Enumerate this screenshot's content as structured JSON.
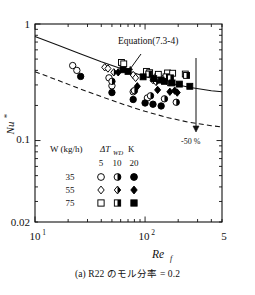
{
  "figure": {
    "caption": "(a) R22 のモル分率 = 0.2",
    "caption_label": "(a)",
    "caption_text": "R22 のモル分率 = 0.2"
  },
  "chart_data": {
    "type": "scatter",
    "title": "",
    "xlabel": "Re_f",
    "xlabel_main": "Re",
    "xlabel_sub": "f",
    "ylabel": "Nu*",
    "ylabel_main": "Nu",
    "ylabel_sup": "*",
    "xscale": "log",
    "yscale": "log",
    "xlim": [
      10,
      500
    ],
    "ylim": [
      0.02,
      1
    ],
    "grid": false,
    "xticklabels": [
      "10",
      "1",
      "10",
      "2",
      "5"
    ],
    "xticks_major": [
      {
        "value": 10,
        "label_base": "10",
        "label_exp": "1"
      },
      {
        "value": 100,
        "label_base": "10",
        "label_exp": "2"
      },
      {
        "value": 500,
        "label_base": "5",
        "label_exp": ""
      }
    ],
    "yticks_major": [
      {
        "value": 1,
        "label": "1"
      },
      {
        "value": 0.1,
        "label": "0.1"
      },
      {
        "value": 0.02,
        "label": "0.02"
      }
    ],
    "annotations": [
      {
        "name": "equation-annotation",
        "text": "Equation(7.3-4)",
        "x": 118,
        "y": 44
      },
      {
        "name": "percent-annotation",
        "text": "-50 %",
        "x": 189,
        "y": 140
      }
    ],
    "curves": [
      {
        "name": "equation-curve",
        "label": "Equation(7.3-4)",
        "style": "solid",
        "points": [
          [
            10,
            0.78
          ],
          [
            16,
            0.66
          ],
          [
            25,
            0.56
          ],
          [
            40,
            0.475
          ],
          [
            63,
            0.41
          ],
          [
            100,
            0.355
          ],
          [
            158,
            0.315
          ],
          [
            250,
            0.287
          ],
          [
            400,
            0.268
          ],
          [
            500,
            0.262
          ]
        ]
      },
      {
        "name": "minus-50-percent-curve",
        "label": "-50 %",
        "style": "dashed",
        "points": [
          [
            10,
            0.39
          ],
          [
            16,
            0.33
          ],
          [
            25,
            0.28
          ],
          [
            40,
            0.238
          ],
          [
            63,
            0.205
          ],
          [
            100,
            0.178
          ],
          [
            158,
            0.158
          ],
          [
            250,
            0.1435
          ],
          [
            400,
            0.134
          ],
          [
            500,
            0.131
          ]
        ]
      }
    ],
    "series": [
      {
        "name": "W35-dT5",
        "W_kg_h": "35",
        "dT_WD_K": "5",
        "marker": "circle-open",
        "points": [
          [
            22,
            0.44
          ],
          [
            24,
            0.4
          ],
          [
            47,
            0.345
          ],
          [
            50,
            0.295
          ],
          [
            78,
            0.262
          ],
          [
            105,
            0.232
          ]
        ]
      },
      {
        "name": "W35-dT10",
        "W_kg_h": "35",
        "dT_WD_K": "10",
        "marker": "circle-half",
        "points": [
          [
            50,
            0.322
          ],
          [
            80,
            0.268
          ],
          [
            112,
            0.242
          ],
          [
            150,
            0.228
          ],
          [
            192,
            0.213
          ]
        ]
      },
      {
        "name": "W35-dT20",
        "W_kg_h": "35",
        "dT_WD_K": "20",
        "marker": "circle-filled",
        "points": [
          [
            26,
            0.355
          ],
          [
            50,
            0.258
          ],
          [
            78,
            0.225
          ],
          [
            100,
            0.21
          ],
          [
            118,
            0.205
          ],
          [
            140,
            0.198
          ]
        ]
      },
      {
        "name": "W55-dT5",
        "W_kg_h": "55",
        "dT_WD_K": "5",
        "marker": "diamond-open",
        "points": [
          [
            43,
            0.425
          ],
          [
            46,
            0.415
          ],
          [
            78,
            0.365
          ],
          [
            82,
            0.345
          ],
          [
            124,
            0.352
          ],
          [
            148,
            0.345
          ],
          [
            158,
            0.335
          ]
        ]
      },
      {
        "name": "W55-dT10",
        "W_kg_h": "55",
        "dT_WD_K": "10",
        "marker": "diamond-half",
        "points": [
          [
            52,
            0.385
          ],
          [
            118,
            0.33
          ],
          [
            126,
            0.318
          ],
          [
            162,
            0.315
          ]
        ]
      },
      {
        "name": "W55-dT20",
        "W_kg_h": "55",
        "dT_WD_K": "20",
        "marker": "diamond-filled",
        "points": [
          [
            57,
            0.385
          ],
          [
            85,
            0.292
          ],
          [
            130,
            0.272
          ],
          [
            168,
            0.262
          ],
          [
            186,
            0.268
          ],
          [
            196,
            0.258
          ]
        ]
      },
      {
        "name": "W75-dT5",
        "W_kg_h": "75",
        "dT_WD_K": "5",
        "marker": "square-open",
        "points": [
          [
            61,
            0.468
          ],
          [
            64,
            0.455
          ],
          [
            103,
            0.392
          ],
          [
            110,
            0.382
          ],
          [
            132,
            0.37
          ],
          [
            160,
            0.38
          ],
          [
            178,
            0.378
          ],
          [
            232,
            0.372
          ]
        ]
      },
      {
        "name": "W75-dT10",
        "W_kg_h": "75",
        "dT_WD_K": "10",
        "marker": "square-half",
        "points": [
          [
            108,
            0.372
          ],
          [
            155,
            0.352
          ],
          [
            170,
            0.345
          ],
          [
            238,
            0.362
          ]
        ]
      },
      {
        "name": "W75-dT20",
        "W_kg_h": "75",
        "dT_WD_K": "20",
        "marker": "square-filled",
        "points": [
          [
            63,
            0.405
          ],
          [
            70,
            0.392
          ],
          [
            96,
            0.352
          ],
          [
            120,
            0.34
          ],
          [
            140,
            0.33
          ],
          [
            150,
            0.322
          ],
          [
            176,
            0.312
          ],
          [
            205,
            0.305
          ],
          [
            255,
            0.292
          ]
        ]
      }
    ]
  },
  "legend": {
    "header_w": "W (kg/h)",
    "header_dt_main": "ΔT",
    "header_dt_sub": "WD",
    "header_unit": "K",
    "columns": [
      "5",
      "10",
      "20"
    ],
    "rows": [
      {
        "w": "35",
        "markers": [
          "circle-open",
          "circle-half",
          "circle-filled"
        ]
      },
      {
        "w": "55",
        "markers": [
          "diamond-open",
          "diamond-half",
          "diamond-filled"
        ]
      },
      {
        "w": "75",
        "markers": [
          "square-open",
          "square-half",
          "square-filled"
        ]
      }
    ]
  },
  "colors": {
    "line": "#111111",
    "background": "#ffffff",
    "marker": "#000000"
  }
}
